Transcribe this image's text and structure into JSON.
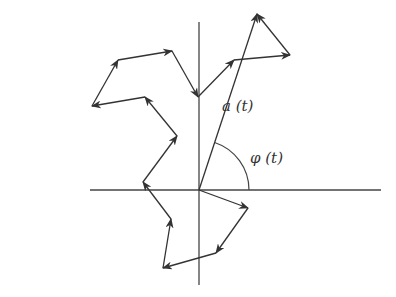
{
  "diagram": {
    "title": "",
    "labels": {
      "amplitude": "a (t)",
      "phase": "φ (t)"
    },
    "colors": {
      "line": "#333333",
      "axis": "#444444",
      "background": "#ffffff"
    },
    "origin": [
      199,
      190
    ],
    "axes": {
      "horizontal": [
        [
          90,
          190
        ],
        [
          381,
          190
        ]
      ],
      "vertical": [
        [
          199,
          22
        ],
        [
          199,
          285
        ]
      ]
    },
    "phasor_chain": [
      [
        199,
        190
      ],
      [
        248,
        208
      ],
      [
        216,
        253
      ],
      [
        163,
        268
      ],
      [
        171,
        219
      ],
      [
        143,
        182
      ],
      [
        177,
        136
      ],
      [
        145,
        97
      ],
      [
        92,
        106
      ],
      [
        118,
        60
      ],
      [
        172,
        51
      ],
      [
        198,
        97
      ],
      [
        234,
        60
      ],
      [
        290,
        55
      ],
      [
        257,
        14
      ]
    ],
    "resultant": {
      "from": [
        199,
        190
      ],
      "to": [
        257,
        14
      ],
      "label": "a (t)"
    },
    "angle_arc": {
      "radius": 50,
      "label": "φ (t)"
    }
  }
}
